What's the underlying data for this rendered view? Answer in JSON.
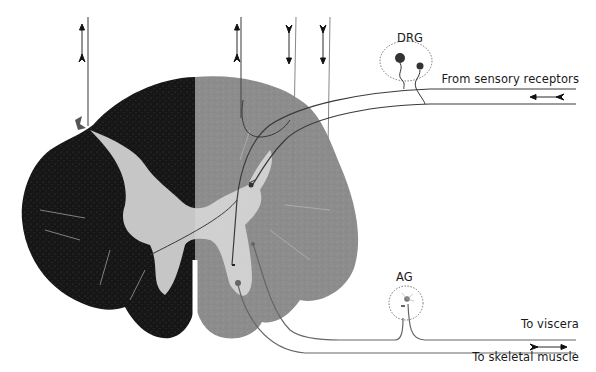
{
  "figure": {
    "labels": {
      "drg": "DRG",
      "ag": "AG",
      "from_sensory": "From sensory receptors",
      "to_viscera": "To viscera",
      "to_skeletal": "To skeletal muscle"
    },
    "ascending_descending_tracts": [
      {
        "id": "left-tract",
        "direction": "ascending",
        "x": 88
      },
      {
        "id": "right-tract-1",
        "direction": "ascending",
        "x": 241
      },
      {
        "id": "right-tract-2",
        "direction": "descending",
        "x": 296
      },
      {
        "id": "right-tract-3",
        "direction": "descending",
        "x": 330
      }
    ],
    "nerve_arrows": {
      "sensory": "leftward (afferent)",
      "motor": "rightward (efferent)"
    },
    "colors": {
      "white_matter_stained": "#141414",
      "white_matter_unstained": "#8a8a8a",
      "gray_matter": "#d9d9d9",
      "lines": "#3a3a3a",
      "background": "#ffffff"
    }
  }
}
